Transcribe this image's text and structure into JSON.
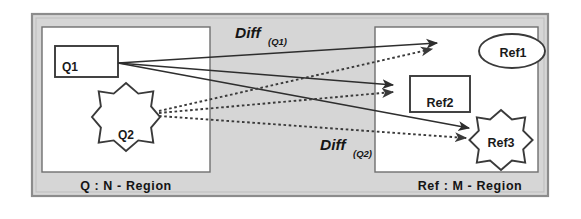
{
  "figure": {
    "background_color": "#ffffff",
    "frame_fill": "#d6d6d6",
    "panel_fill": "#ffffff",
    "stroke_color": "#3a3a3a"
  },
  "panels": [
    {
      "id": "query-panel",
      "label": "Q : N - Region",
      "label_x": 126,
      "label_y": 190
    },
    {
      "id": "reference-panel",
      "label": "Ref : M - Region",
      "label_x": 470,
      "label_y": 190
    }
  ],
  "query_shapes": [
    {
      "id": "q1",
      "label": "Q1",
      "shape": "rectangle",
      "x": 55,
      "y": 46,
      "width": 63,
      "height": 31,
      "label_x": 62,
      "label_y": 71,
      "font_size": 12
    },
    {
      "id": "q2",
      "label": "Q2",
      "shape": "eight-point-star",
      "cx": 126,
      "cy": 117,
      "outer_r": 34,
      "inner_r": 26,
      "label_x": 126,
      "label_y": 139,
      "font_size": 12
    }
  ],
  "reference_shapes": [
    {
      "id": "ref1",
      "label": "Ref1",
      "shape": "ellipse",
      "cx": 512,
      "cy": 51,
      "rx": 33,
      "ry": 17,
      "label_x": 513,
      "label_y": 57,
      "font_size": 12.5
    },
    {
      "id": "ref2",
      "label": "Ref2",
      "shape": "rectangle",
      "x": 410,
      "y": 76,
      "width": 60,
      "height": 36,
      "label_x": 440,
      "label_y": 107,
      "font_size": 12.5
    },
    {
      "id": "ref3",
      "label": "Ref3",
      "shape": "eight-point-star",
      "cx": 501,
      "cy": 140,
      "outer_r": 30,
      "inner_r": 23,
      "label_x": 501,
      "label_y": 147,
      "font_size": 12.5
    }
  ],
  "diff_labels": [
    {
      "id": "diff-q1",
      "main": "Diff",
      "sub": "(Q1)",
      "x": 235,
      "y": 38
    },
    {
      "id": "diff-q2",
      "main": "Diff",
      "sub": "(Q2)",
      "x": 320,
      "y": 150
    }
  ],
  "solid_arrows": [
    {
      "id": "q1-to-ref1",
      "x1": 118,
      "y1": 63,
      "x2": 437,
      "y2": 43
    },
    {
      "id": "q1-to-ref2",
      "x1": 118,
      "y1": 63,
      "x2": 393,
      "y2": 85
    },
    {
      "id": "q1-to-ref3",
      "x1": 118,
      "y1": 63,
      "x2": 469,
      "y2": 128
    }
  ],
  "dotted_arrows": [
    {
      "id": "q2-to-ref1",
      "x1": 159,
      "y1": 111,
      "x2": 432,
      "y2": 49
    },
    {
      "id": "q2-to-ref2",
      "x1": 159,
      "y1": 113,
      "x2": 393,
      "y2": 92
    },
    {
      "id": "q2-to-ref3",
      "x1": 159,
      "y1": 116,
      "x2": 466,
      "y2": 138
    }
  ]
}
